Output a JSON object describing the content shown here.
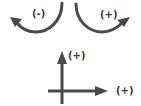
{
  "diagram": {
    "rotation_negative": {
      "label": "(-)",
      "direction": "clockwise-left"
    },
    "rotation_positive": {
      "label": "(+)",
      "direction": "counterclockwise-right"
    },
    "axes": {
      "vertical": {
        "label": "(+)"
      },
      "horizontal": {
        "label": "(+)"
      }
    },
    "colors": {
      "stroke": "#4a4a4a",
      "background": "#ffffff"
    }
  }
}
